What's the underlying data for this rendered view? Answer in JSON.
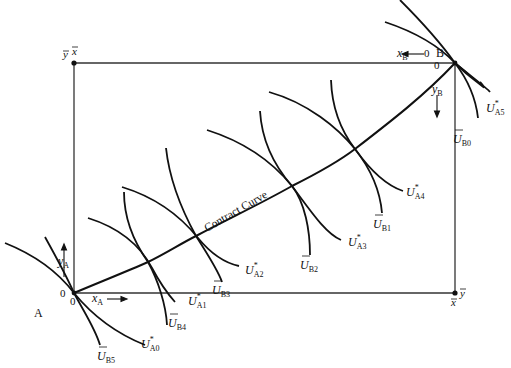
{
  "diagram": {
    "type": "edgeworth-box",
    "origin_a": {
      "label": "A",
      "zero_x": "0",
      "zero_y": "0"
    },
    "origin_b": {
      "label": "B",
      "zero_x": "0",
      "zero_y": "0"
    },
    "axes": {
      "x_a": {
        "var": "x",
        "sub": "A"
      },
      "y_a": {
        "var": "y",
        "sub": "A"
      },
      "x_b": {
        "var": "x",
        "sub": "B"
      },
      "y_b": {
        "var": "y",
        "sub": "B"
      }
    },
    "totals": {
      "top_left_y": "y",
      "top_left_x": "x",
      "bottom_right_x": "x",
      "bottom_right_y": "y"
    },
    "contract_curve_label": "Contract Curve",
    "indifference_curves": {
      "A": [
        {
          "base": "U",
          "sup": "*",
          "sub": "A0"
        },
        {
          "base": "U",
          "sup": "*",
          "sub": "A1"
        },
        {
          "base": "U",
          "sup": "*",
          "sub": "A2"
        },
        {
          "base": "U",
          "sup": "*",
          "sub": "A3"
        },
        {
          "base": "U",
          "sup": "*",
          "sub": "A4"
        },
        {
          "base": "U",
          "sup": "*",
          "sub": "A5"
        }
      ],
      "B": [
        {
          "base": "U",
          "bar": true,
          "sub": "B0"
        },
        {
          "base": "U",
          "bar": true,
          "sub": "B1"
        },
        {
          "base": "U",
          "bar": true,
          "sub": "B2"
        },
        {
          "base": "U",
          "bar": true,
          "sub": "B3"
        },
        {
          "base": "U",
          "bar": true,
          "sub": "B4"
        },
        {
          "base": "U",
          "bar": true,
          "sub": "B5"
        }
      ]
    }
  }
}
